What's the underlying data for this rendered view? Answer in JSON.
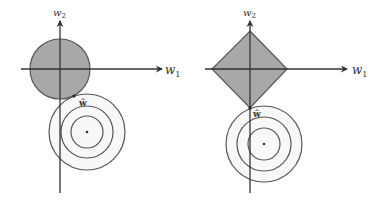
{
  "figure": {
    "colors": {
      "region_fill": "#a8a8a8",
      "region_stroke": "#555555",
      "axis": "#333333",
      "contour": "#555555",
      "contour_fill": "#f7f7f7"
    },
    "panels": [
      {
        "name": "l2-ridge",
        "axis_x_label": "w",
        "axis_x_sub": "1",
        "axis_y_label": "w",
        "axis_y_sub": "2",
        "constraint_shape": "circle",
        "optimum_label": "ŵ",
        "contour_count": 3
      },
      {
        "name": "l1-lasso",
        "axis_x_label": "w",
        "axis_x_sub": "1",
        "axis_y_label": "w",
        "axis_y_sub": "2",
        "constraint_shape": "diamond",
        "optimum_label": "ŵ",
        "contour_count": 3
      }
    ]
  }
}
